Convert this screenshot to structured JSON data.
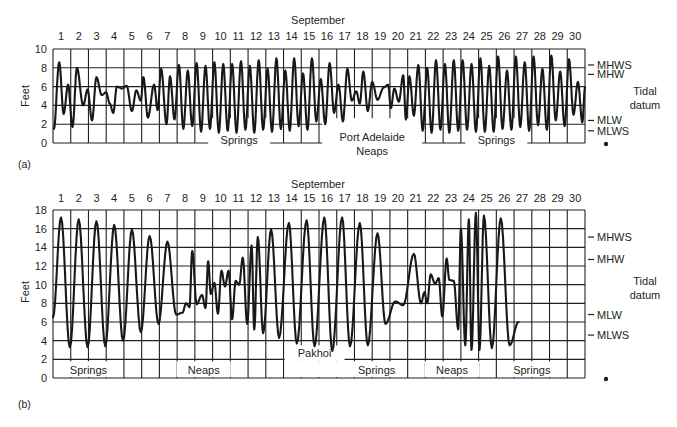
{
  "figure": {
    "panel_a_label": "(a)",
    "panel_b_label": "(b)"
  },
  "chart_data": [
    {
      "type": "line",
      "panel": "(a)",
      "title": "September",
      "station": "Port Adelaide",
      "xlabel": "September (day)",
      "ylabel": "Feet",
      "ylim": [
        0,
        10
      ],
      "yticks": [
        0,
        2,
        4,
        6,
        8,
        10
      ],
      "x_tick_labels": [
        "1",
        "2",
        "3",
        "4",
        "5",
        "6",
        "7",
        "8",
        "9",
        "10",
        "11",
        "12",
        "13",
        "14",
        "15",
        "16",
        "17",
        "18",
        "19",
        "20",
        "21",
        "22",
        "23",
        "24",
        "25",
        "26",
        "27",
        "28",
        "29",
        "30"
      ],
      "grid": true,
      "right_axis_title": "Tidal datum",
      "datum_levels": [
        {
          "name": "MHWS",
          "value": 8.3
        },
        {
          "name": "MHW",
          "value": 7.3
        },
        {
          "name": "MLW",
          "value": 2.4
        },
        {
          "name": "MLWS",
          "value": 1.3
        }
      ],
      "bands": [
        {
          "label": "Springs",
          "from_day": 8.5,
          "to_day": 12.5
        },
        {
          "label": "Port Adelaide",
          "label2": "Neaps",
          "from_day": 16,
          "to_day": 20
        },
        {
          "label": "Springs",
          "from_day": 23,
          "to_day": 27
        }
      ],
      "series": [
        {
          "name": "Tide height (ft)",
          "description": "Successive high/low water extremes, x in days from start of Sept 1",
          "x": [
            0.05,
            0.35,
            0.6,
            0.85,
            1.1,
            1.35,
            1.7,
            1.95,
            2.2,
            2.45,
            2.75,
            3.0,
            3.2,
            3.4,
            3.6,
            3.9,
            4.15,
            4.45,
            4.7,
            4.95,
            5.1,
            5.35,
            5.7,
            5.9,
            6.1,
            6.4,
            6.6,
            6.85,
            7.1,
            7.35,
            7.6,
            7.85,
            8.1,
            8.35,
            8.6,
            8.85,
            9.1,
            9.35,
            9.6,
            9.85,
            10.1,
            10.35,
            10.6,
            10.85,
            11.1,
            11.35,
            11.6,
            11.85,
            12.1,
            12.35,
            12.6,
            12.85,
            13.1,
            13.35,
            13.6,
            13.85,
            14.1,
            14.35,
            14.6,
            14.85,
            15.1,
            15.35,
            15.6,
            15.85,
            16.1,
            16.35,
            16.6,
            16.85,
            17.1,
            17.3,
            17.5,
            17.75,
            18.0,
            18.3,
            18.65,
            18.9,
            19.05,
            19.25,
            19.5,
            19.75,
            19.9,
            20.1,
            20.35,
            20.6,
            20.85,
            21.1,
            21.35,
            21.6,
            21.85,
            22.1,
            22.35,
            22.6,
            22.85,
            23.1,
            23.35,
            23.6,
            23.85,
            24.1,
            24.35,
            24.6,
            24.85,
            25.1,
            25.35,
            25.6,
            25.85,
            26.1,
            26.35,
            26.6,
            26.85,
            27.1,
            27.35,
            27.6,
            27.85,
            28.1,
            28.35,
            28.6,
            28.85,
            29.1,
            29.35,
            29.6,
            29.85,
            30.0
          ],
          "y": [
            1.5,
            8.6,
            3.1,
            6.2,
            1.7,
            8.0,
            4.0,
            5.7,
            2.4,
            7.0,
            5.1,
            5.4,
            4.2,
            3.2,
            6.0,
            5.8,
            6.1,
            3.4,
            5.6,
            4.5,
            7.0,
            2.7,
            6.2,
            3.5,
            7.9,
            2.0,
            7.1,
            2.5,
            8.3,
            1.5,
            7.7,
            1.8,
            8.5,
            1.2,
            8.2,
            1.5,
            8.6,
            1.1,
            8.4,
            1.3,
            8.4,
            1.1,
            8.7,
            1.4,
            8.2,
            1.1,
            8.8,
            1.4,
            7.9,
            1.2,
            9.0,
            1.5,
            7.7,
            1.3,
            9.0,
            1.8,
            7.4,
            1.4,
            9.0,
            2.3,
            6.8,
            2.0,
            8.5,
            3.2,
            6.2,
            2.3,
            7.9,
            4.5,
            5.5,
            4.2,
            7.6,
            3.4,
            6.5,
            4.6,
            5.9,
            6.2,
            3.7,
            5.8,
            4.4,
            7.2,
            2.5,
            7.1,
            2.9,
            8.3,
            1.3,
            8.0,
            1.1,
            8.8,
            1.4,
            8.4,
            1.1,
            8.8,
            1.3,
            8.8,
            1.4,
            8.4,
            1.2,
            9.0,
            1.2,
            8.2,
            1.2,
            9.2,
            1.5,
            7.7,
            1.4,
            9.2,
            1.7,
            8.6,
            1.3,
            9.2,
            1.9,
            7.9,
            1.4,
            9.3,
            2.4,
            7.6,
            1.8,
            8.9,
            3.0,
            6.5,
            2.2,
            5.9
          ]
        }
      ]
    },
    {
      "type": "line",
      "panel": "(b)",
      "title": "September",
      "station": "Pakhoi",
      "xlabel": "September (day)",
      "ylabel": "Feet",
      "ylim": [
        0,
        18
      ],
      "yticks": [
        0,
        2,
        4,
        6,
        8,
        10,
        12,
        14,
        16,
        18
      ],
      "x_tick_labels": [
        "1",
        "2",
        "3",
        "4",
        "5",
        "6",
        "7",
        "8",
        "9",
        "10",
        "11",
        "12",
        "13",
        "14",
        "15",
        "16",
        "17",
        "18",
        "19",
        "20",
        "21",
        "22",
        "23",
        "24",
        "25",
        "26",
        "27",
        "28",
        "29",
        "30"
      ],
      "grid": true,
      "right_axis_title": "Tidal datum",
      "datum_levels": [
        {
          "name": "MHWS",
          "value": 15.1
        },
        {
          "name": "MHW",
          "value": 12.7
        },
        {
          "name": "MLW",
          "value": 6.8
        },
        {
          "name": "MLWS",
          "value": 4.6
        }
      ],
      "bands": [
        {
          "label": "Springs",
          "from_day": 0,
          "to_day": 4
        },
        {
          "label": "Neaps",
          "from_day": 7,
          "to_day": 10
        },
        {
          "label": "Pakhoi",
          "from_day": 13.5,
          "to_day": 16
        },
        {
          "label": "Springs",
          "from_day": 16.5,
          "to_day": 20
        },
        {
          "label": "Neaps",
          "from_day": 21,
          "to_day": 24
        },
        {
          "label": "Springs",
          "from_day": 25,
          "to_day": 29
        }
      ],
      "series": [
        {
          "name": "Tide height (ft)",
          "description": "Diurnal tide extremes, x in days from start of Sept 1",
          "x": [
            0.0,
            0.45,
            0.95,
            1.45,
            1.95,
            2.45,
            2.95,
            3.45,
            3.95,
            4.45,
            4.95,
            5.45,
            5.95,
            6.45,
            6.95,
            7.3,
            7.5,
            7.7,
            7.85,
            8.1,
            8.4,
            8.6,
            8.75,
            8.9,
            9.1,
            9.3,
            9.5,
            9.7,
            9.9,
            10.1,
            10.3,
            10.5,
            10.7,
            10.95,
            11.2,
            11.35,
            11.55,
            11.85,
            12.3,
            12.75,
            13.3,
            13.75,
            14.3,
            14.75,
            15.3,
            15.75,
            16.3,
            16.75,
            17.3,
            17.75,
            18.3,
            18.75,
            19.3,
            19.75,
            20.35,
            20.75,
            20.95,
            21.1,
            21.3,
            21.55,
            21.75,
            21.95,
            22.2,
            22.35,
            22.6,
            22.85,
            23.0,
            23.25,
            23.45,
            23.6,
            23.85,
            24.05,
            24.3,
            24.75,
            25.25,
            25.75,
            26.25,
            26.75,
            27.3,
            27.75,
            28.3,
            28.75,
            29.3,
            29.75,
            30.0
          ],
          "y": [
            6.5,
            17.2,
            3.3,
            17.0,
            3.3,
            16.8,
            3.4,
            16.4,
            4.0,
            15.9,
            4.9,
            15.2,
            5.8,
            14.6,
            6.8,
            7.0,
            8.0,
            7.6,
            13.6,
            7.9,
            8.9,
            7.5,
            12.5,
            9.0,
            10.2,
            6.9,
            11.5,
            9.8,
            11.5,
            6.3,
            10.4,
            10.0,
            12.9,
            5.8,
            14.2,
            5.2,
            15.1,
            4.8,
            15.9,
            4.3,
            16.6,
            3.7,
            16.9,
            3.4,
            17.2,
            2.9,
            17.2,
            3.4,
            16.6,
            3.5,
            15.5,
            5.8,
            8.2,
            7.8,
            13.3,
            8.0,
            9.2,
            8.0,
            11.1,
            10.1,
            10.7,
            6.6,
            12.8,
            10.5,
            10.4,
            5.2,
            16.0,
            3.5,
            17.0,
            3.0,
            17.7,
            3.0,
            17.4,
            3.2,
            17.1,
            3.5,
            6.0
          ]
        }
      ]
    }
  ]
}
